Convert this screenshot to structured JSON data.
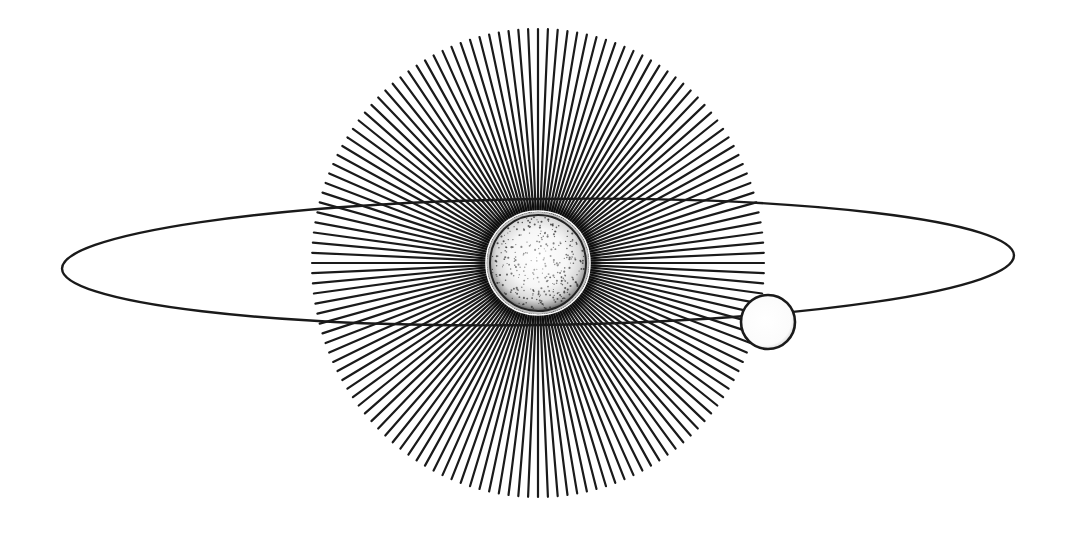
{
  "diagram": {
    "type": "orbit-illustration",
    "colors": {
      "background": "#ffffff",
      "ink": "#1a1a1a",
      "sun_fill": "#ffffff",
      "planet_fill": "#ffffff"
    },
    "star": {
      "center": [
        538,
        263
      ],
      "core_radius": 48,
      "ray_outer_radius_x": 226,
      "ray_outer_radius_y": 234,
      "ray_count": 144,
      "ray_width": 2.2
    },
    "orbit": {
      "center": [
        538,
        262
      ],
      "rx": 476,
      "ry": 63,
      "rotation_deg": -0.8
    },
    "planet": {
      "center": [
        768,
        322
      ],
      "radius": 27
    }
  }
}
